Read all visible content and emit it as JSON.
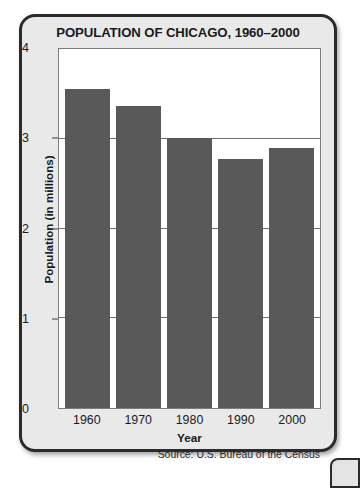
{
  "chart_data": {
    "type": "bar",
    "title": "POPULATION OF CHICAGO, 1960–2000",
    "xlabel": "Year",
    "ylabel": "Population (in millions)",
    "categories": [
      "1960",
      "1970",
      "1980",
      "1990",
      "2000"
    ],
    "values": [
      3.55,
      3.37,
      3.01,
      2.78,
      2.9
    ],
    "ylim": [
      0,
      4
    ],
    "yticks": [
      "0",
      "1",
      "2",
      "3",
      "4"
    ],
    "ytick_values": [
      0,
      1,
      2,
      3,
      4
    ],
    "gridlines": [
      1,
      2,
      3
    ],
    "grid": true,
    "legend": "none",
    "source": "Source: U.S. Bureau of the Census",
    "bar_color": "#595959",
    "plot_background": "#ffffff",
    "panel_background": "#e9e9e9",
    "border_color": "#2b2b2b"
  }
}
